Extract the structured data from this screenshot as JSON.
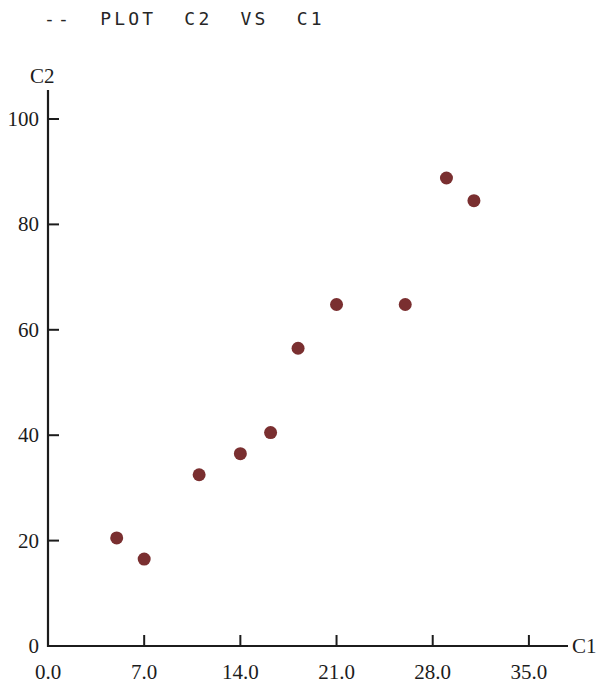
{
  "title": "--  PLOT  C2  VS  C1",
  "chart_data": {
    "type": "scatter",
    "title": "--  PLOT  C2  VS  C1",
    "xlabel": "C1",
    "ylabel": "C2",
    "xlim": [
      0,
      38
    ],
    "ylim": [
      0,
      105
    ],
    "xticks": [
      0.0,
      7.0,
      14.0,
      21.0,
      28.0,
      35.0
    ],
    "xtick_labels": [
      "0.0",
      "7.0",
      "14.0",
      "21.0",
      "28.0",
      "35.0"
    ],
    "yticks": [
      0,
      20,
      40,
      60,
      80,
      100
    ],
    "ytick_labels": [
      "0",
      "20",
      "40",
      "60",
      "80",
      "100"
    ],
    "grid": false,
    "legend": null,
    "marker": {
      "shape": "circle",
      "color": "#7a2f30",
      "size_px": 13
    },
    "points": [
      {
        "x": 5.0,
        "y": 20.5
      },
      {
        "x": 7.0,
        "y": 16.5
      },
      {
        "x": 11.0,
        "y": 32.5
      },
      {
        "x": 14.0,
        "y": 36.5
      },
      {
        "x": 16.2,
        "y": 40.5
      },
      {
        "x": 18.2,
        "y": 56.5
      },
      {
        "x": 21.0,
        "y": 64.8
      },
      {
        "x": 26.0,
        "y": 64.8
      },
      {
        "x": 29.0,
        "y": 88.8
      },
      {
        "x": 31.0,
        "y": 84.5
      }
    ]
  },
  "colors": {
    "marker": "#7a2f30",
    "axis": "#1c1c1c",
    "background": "#ffffff"
  }
}
